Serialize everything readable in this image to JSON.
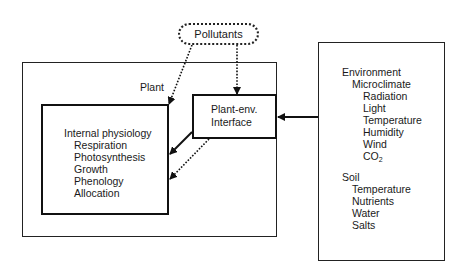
{
  "diagram": {
    "pollutants": {
      "label": "Pollutants"
    },
    "plant": {
      "label": "Plant"
    },
    "interface": {
      "line1": "Plant-env.",
      "line2": "Interface"
    },
    "internal_physiology": {
      "heading": "Internal physiology",
      "items": [
        "Respiration",
        "Photosynthesis",
        "Growth",
        "Phenology",
        "Allocation"
      ]
    },
    "environment": {
      "heading": "Environment",
      "microclimate": {
        "heading": "Microclimate",
        "items": [
          "Radiation",
          "Light",
          "Temperature",
          "Humidity",
          "Wind"
        ],
        "co2_base": "CO",
        "co2_sub": "2"
      },
      "soil": {
        "heading": "Soil",
        "items": [
          "Temperature",
          "Nutrients",
          "Water",
          "Salts"
        ]
      }
    },
    "edges": [
      {
        "from": "Pollutants",
        "to": "Internal physiology",
        "style": "dotted"
      },
      {
        "from": "Pollutants",
        "to": "Plant-env. Interface",
        "style": "dotted"
      },
      {
        "from": "Environment",
        "to": "Plant-env. Interface",
        "style": "solid"
      },
      {
        "from": "Plant-env. Interface",
        "to": "Internal physiology",
        "style": "solid"
      },
      {
        "from": "Plant-env. Interface",
        "to": "Internal physiology",
        "style": "dotted"
      }
    ],
    "colors": {
      "line": "#111111",
      "background": "#ffffff"
    }
  }
}
